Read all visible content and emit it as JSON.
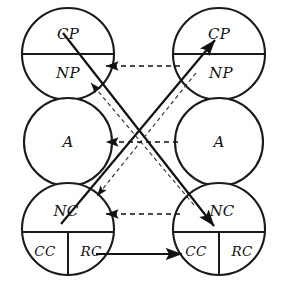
{
  "diagram": {
    "type": "transactional-analysis-ego-state-diagram",
    "title": "",
    "background_color": "#ffffff",
    "line_color": "#111111",
    "canvas": {
      "width": 282,
      "height": 283
    },
    "persons": [
      {
        "id": "left",
        "side": "left",
        "center_x": 68,
        "ego_states": [
          {
            "id": "left-parent",
            "name": "parent",
            "center_y": 54,
            "radius": 46,
            "divided": "horizontal",
            "segments": [
              {
                "id": "left-cp",
                "label": "CP",
                "meaning": "Critical Parent",
                "x": 68,
                "y": 34
              },
              {
                "id": "left-np",
                "label": "NP",
                "meaning": "Nurturing Parent",
                "x": 68,
                "y": 74
              }
            ]
          },
          {
            "id": "left-adult",
            "name": "adult",
            "center_y": 142,
            "radius": 44,
            "divided": "none",
            "segments": [
              {
                "id": "left-a",
                "label": "A",
                "meaning": "Adult",
                "x": 68,
                "y": 142
              }
            ]
          },
          {
            "id": "left-child",
            "name": "child",
            "center_y": 229,
            "radius": 46,
            "divided": "horizontal-and-vertical",
            "segments": [
              {
                "id": "left-nc",
                "label": "NC",
                "meaning": "Natural Child",
                "x": 68,
                "y": 212
              },
              {
                "id": "left-cc",
                "label": "CC",
                "meaning": "Compliant Child",
                "x": 46,
                "y": 250
              },
              {
                "id": "left-rc",
                "label": "RC",
                "meaning": "Rebellious Child",
                "x": 90,
                "y": 250
              }
            ]
          }
        ]
      },
      {
        "id": "right",
        "side": "right",
        "center_x": 219,
        "ego_states": [
          {
            "id": "right-parent",
            "name": "parent",
            "center_y": 54,
            "radius": 46,
            "divided": "horizontal",
            "segments": [
              {
                "id": "right-cp",
                "label": "CP",
                "meaning": "Critical Parent",
                "x": 219,
                "y": 34
              },
              {
                "id": "right-np",
                "label": "NP",
                "meaning": "Nurturing Parent",
                "x": 219,
                "y": 74
              }
            ]
          },
          {
            "id": "right-adult",
            "name": "adult",
            "center_y": 142,
            "radius": 44,
            "divided": "none",
            "segments": [
              {
                "id": "right-a",
                "label": "A",
                "meaning": "Adult",
                "x": 219,
                "y": 142
              }
            ]
          },
          {
            "id": "right-child",
            "name": "child",
            "center_y": 229,
            "radius": 46,
            "divided": "horizontal-and-vertical",
            "segments": [
              {
                "id": "right-nc",
                "label": "NC",
                "meaning": "Natural Child",
                "x": 219,
                "y": 212
              },
              {
                "id": "right-cc",
                "label": "CC",
                "meaning": "Compliant Child",
                "x": 197,
                "y": 250
              },
              {
                "id": "right-rc",
                "label": "RC",
                "meaning": "Rebellious Child",
                "x": 241,
                "y": 250
              }
            ]
          }
        ]
      }
    ],
    "transactions": [
      {
        "id": "solid-cp-to-nc",
        "style": "solid",
        "from": "left-cp",
        "to": "right-nc",
        "direction": "down-right",
        "arrowhead": "end"
      },
      {
        "id": "solid-nc-to-cp",
        "style": "solid",
        "from": "left-nc",
        "to": "right-cp",
        "direction": "up-right",
        "arrowhead": "end"
      },
      {
        "id": "dashed-np-to-nc",
        "style": "dashed",
        "from": "right-np",
        "to": "left-nc",
        "direction": "down-left",
        "arrowhead": "end"
      },
      {
        "id": "dashed-nc-to-cp",
        "style": "dashed",
        "from": "right-nc",
        "to": "left-cp",
        "direction": "up-left",
        "arrowhead": "end"
      },
      {
        "id": "dashed-horizontal-parent",
        "style": "dashed",
        "from": "right-np",
        "to": "left-np",
        "direction": "left",
        "arrowhead": "end",
        "y": 66
      },
      {
        "id": "dashed-horizontal-adult",
        "style": "dashed",
        "from": "right-adult",
        "to": "left-adult",
        "direction": "left",
        "arrowhead": "end",
        "y": 142
      },
      {
        "id": "dashed-horizontal-child",
        "style": "dashed",
        "from": "right-nc",
        "to": "left-nc",
        "direction": "left",
        "arrowhead": "end",
        "y": 214
      },
      {
        "id": "solid-horizontal-cc",
        "style": "solid",
        "from": "left-rc",
        "to": "right-cc",
        "direction": "right",
        "arrowhead": "end",
        "y": 254
      }
    ]
  }
}
